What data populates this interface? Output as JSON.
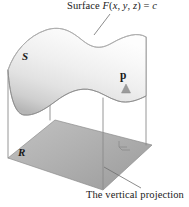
{
  "figure": {
    "title_label": {
      "prefix": "Surface ",
      "func": "F",
      "args_open": "(",
      "arg_x": "x",
      "comma1": ", ",
      "arg_y": "y",
      "comma2": ", ",
      "arg_z": "z",
      "args_close": ")",
      "equals": " = ",
      "constant": "c",
      "full_text": "Surface F(x, y, z) = c"
    },
    "caption": "The vertical projection",
    "surface_label": "S",
    "region_label": "R",
    "vector_label": "p",
    "colors": {
      "outline": "#6e6e6e",
      "surface_light": "#fbfbfb",
      "surface_mid": "#e3e3e3",
      "surface_dark": "#c9c9c9",
      "plane_light": "#b9b9b9",
      "plane_dark": "#9a9a9a",
      "text": "#1a1a1a",
      "arrow": "#9b9b9b",
      "leader": "#6e6e6e",
      "background": "#ffffff"
    },
    "geometry": {
      "plane_corners": [
        [
          8,
          158
        ],
        [
          55,
          120
        ],
        [
          152,
          145
        ],
        [
          103,
          190
        ]
      ],
      "vertical_lines": [
        {
          "x": 8,
          "y_top": 70,
          "y_bottom": 158
        },
        {
          "x": 50,
          "y_top": 73,
          "y_bottom": 120
        },
        {
          "x": 103,
          "y_top": 98,
          "y_bottom": 189
        },
        {
          "x": 146,
          "y_top": 37,
          "y_bottom": 145
        }
      ],
      "arrow": {
        "x": 126,
        "y_base": 145,
        "y_tip": 86
      },
      "right_angle_marker": {
        "x": 126,
        "y": 145,
        "size": 7
      },
      "leader_title": [
        [
          95,
          34
        ],
        [
          110,
          13
        ]
      ],
      "leader_caption": [
        [
          104,
          168
        ],
        [
          140,
          188
        ]
      ]
    }
  }
}
